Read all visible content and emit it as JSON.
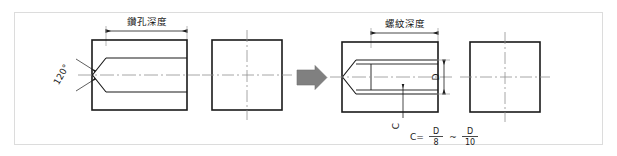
{
  "figure": {
    "title_left": "鑽孔深度",
    "title_right": "螺紋深度",
    "angle_label": "120°",
    "diameter_label": "D",
    "chamfer_label": "C",
    "formula": {
      "lead": "C=",
      "num1": "D",
      "den1": "8",
      "tilde": "~",
      "num2": "D",
      "den2": "10"
    },
    "colors": {
      "line": "#1a1a1a",
      "centerline": "#8f8f8f",
      "arrow_fill": "#808080",
      "border": "#d8d8d8",
      "background": "#ffffff"
    }
  }
}
